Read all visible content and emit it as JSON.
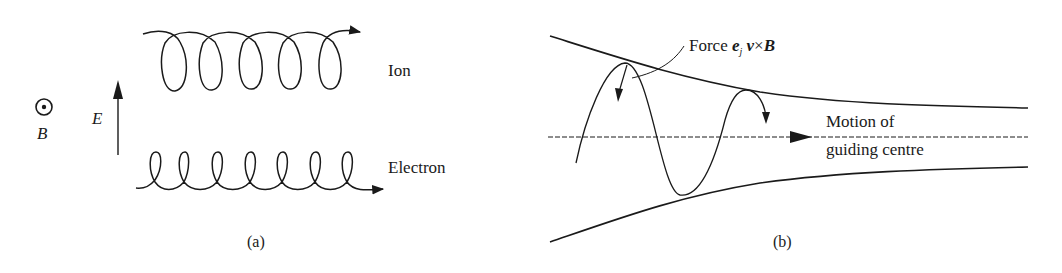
{
  "figure": {
    "panel_a": {
      "caption": "(a)",
      "b_field_label": "B",
      "b_field_symbol": "dot-in-circle (out of page)",
      "e_field_label": "E",
      "ion_label": "Ion",
      "electron_label": "Electron"
    },
    "panel_b": {
      "caption": "(b)",
      "force_label_prefix": "Force ",
      "force_e": "e",
      "force_sub": "j",
      "force_v": " v",
      "force_cross": "×",
      "force_B": "B",
      "motion_label_line1": "Motion of",
      "motion_label_line2": "guiding centre"
    }
  },
  "colors": {
    "ink": "#1a1a1a",
    "background": "#ffffff"
  }
}
